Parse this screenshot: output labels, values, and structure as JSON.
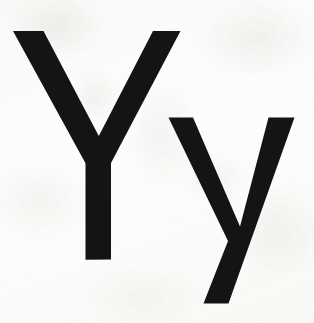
{
  "image": {
    "kind": "letter-card",
    "description": "Printed alphabet card showing the letter Y in uppercase and lowercase on off-white paper",
    "width": 314,
    "height": 323,
    "background_color": "#fdfdfc",
    "ink_color": "#141414",
    "paper_tint_color": "#e8e8e5"
  },
  "letters": [
    {
      "id": "uppercase-y",
      "character": "Y",
      "case": "uppercase",
      "name": "capital letter y",
      "bbox": {
        "x": 12,
        "y": 31,
        "width": 168,
        "height": 229
      }
    },
    {
      "id": "lowercase-y",
      "character": "y",
      "case": "lowercase",
      "name": "small letter y",
      "bbox": {
        "x": 168,
        "y": 117,
        "width": 127,
        "height": 187
      }
    }
  ],
  "caption": "Y y"
}
